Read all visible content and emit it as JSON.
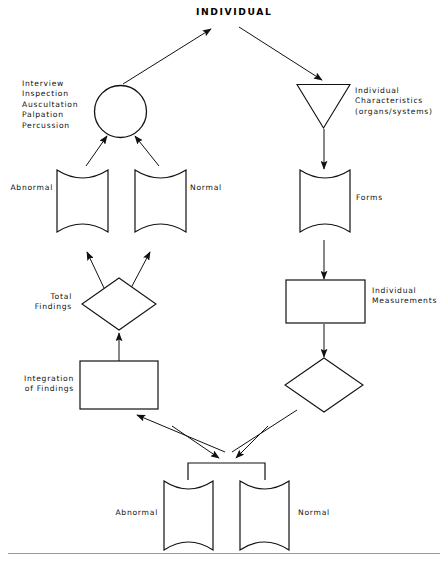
{
  "diagram": {
    "title": "INDIVIDUAL",
    "labels": {
      "methods": "Interview\nInspection\nAuscultation\nPalpation\nPercussion",
      "abnormal_upper": "Abnormal",
      "normal_upper": "Normal",
      "individual_characteristics": "Individual\nCharacteristics\n(organs/systems)",
      "forms": "Forms",
      "individual_measurements": "Individual\nMeasurements",
      "total_findings": "Total\nFindings",
      "integration_of_findings": "Integration\nof Findings",
      "abnormal_lower": "Abnormal",
      "normal_lower": "Normal"
    },
    "nodes": [
      {
        "id": "circle-node",
        "shape": "circle",
        "label": ""
      },
      {
        "id": "triangle-node",
        "shape": "triangle-down",
        "label": ""
      },
      {
        "id": "abnormal-upper-doc",
        "shape": "document",
        "label": "Abnormal"
      },
      {
        "id": "normal-upper-doc",
        "shape": "document",
        "label": "Normal"
      },
      {
        "id": "forms-doc",
        "shape": "document",
        "label": "Forms"
      },
      {
        "id": "total-findings-diamond",
        "shape": "diamond",
        "label": "Total Findings"
      },
      {
        "id": "individual-measurements-rect",
        "shape": "rectangle",
        "label": "Individual Measurements"
      },
      {
        "id": "integration-rect",
        "shape": "rectangle",
        "label": "Integration of Findings"
      },
      {
        "id": "decision-diamond",
        "shape": "diamond",
        "label": ""
      },
      {
        "id": "abnormal-lower-doc",
        "shape": "document",
        "label": "Abnormal"
      },
      {
        "id": "normal-lower-doc",
        "shape": "document",
        "label": "Normal"
      }
    ],
    "colors": {
      "stroke": "#111111",
      "fill": "#ffffff",
      "text": "#111111",
      "background": "#ffffff",
      "rule": "#9a9a9a"
    }
  }
}
